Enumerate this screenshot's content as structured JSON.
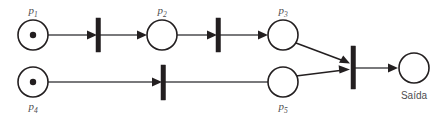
{
  "diagram": {
    "type": "petri-net",
    "title": "",
    "width": 444,
    "height": 116,
    "colors": {
      "background": "#ffffff",
      "stroke": "#231f20",
      "arc": "#4d4d4f",
      "label": "#4d4d4f",
      "token": "#231f20"
    },
    "places": [
      {
        "id": "p1",
        "label": "p",
        "subscript": "1",
        "label_position": "above",
        "tokens": 1,
        "cx": 33,
        "cy": 35,
        "r": 15
      },
      {
        "id": "p2",
        "label": "p",
        "subscript": "2",
        "label_position": "above",
        "tokens": 0,
        "cx": 162,
        "cy": 35,
        "r": 15
      },
      {
        "id": "p3",
        "label": "p",
        "subscript": "3",
        "label_position": "above",
        "tokens": 0,
        "cx": 283,
        "cy": 35,
        "r": 15
      },
      {
        "id": "p4",
        "label": "p",
        "subscript": "4",
        "label_position": "below",
        "tokens": 1,
        "cx": 33,
        "cy": 82,
        "r": 15
      },
      {
        "id": "p5",
        "label": "p",
        "subscript": "5",
        "label_position": "below",
        "tokens": 0,
        "cx": 283,
        "cy": 82,
        "r": 15
      },
      {
        "id": "pout",
        "label": "Saída",
        "subscript": "",
        "label_position": "below",
        "tokens": 0,
        "cx": 414,
        "cy": 68,
        "r": 15
      }
    ],
    "transitions": [
      {
        "id": "t1",
        "x": 98,
        "y_top": 18,
        "y_bottom": 52,
        "width": 4
      },
      {
        "id": "t2",
        "x": 218,
        "y_top": 18,
        "y_bottom": 52,
        "width": 4
      },
      {
        "id": "t3",
        "x": 163,
        "y_top": 65,
        "y_bottom": 100,
        "width": 4
      },
      {
        "id": "t4",
        "x": 353,
        "y_top": 46,
        "y_bottom": 89,
        "width": 4
      }
    ],
    "arcs": [
      {
        "from": "p1",
        "to": "t1"
      },
      {
        "from": "t1",
        "to": "p2"
      },
      {
        "from": "p2",
        "to": "t2"
      },
      {
        "from": "t2",
        "to": "p3"
      },
      {
        "from": "p4",
        "to": "t3"
      },
      {
        "from": "t3",
        "to": "p5"
      },
      {
        "from": "p3",
        "to": "t4"
      },
      {
        "from": "p5",
        "to": "t4"
      },
      {
        "from": "t4",
        "to": "pout"
      }
    ]
  }
}
